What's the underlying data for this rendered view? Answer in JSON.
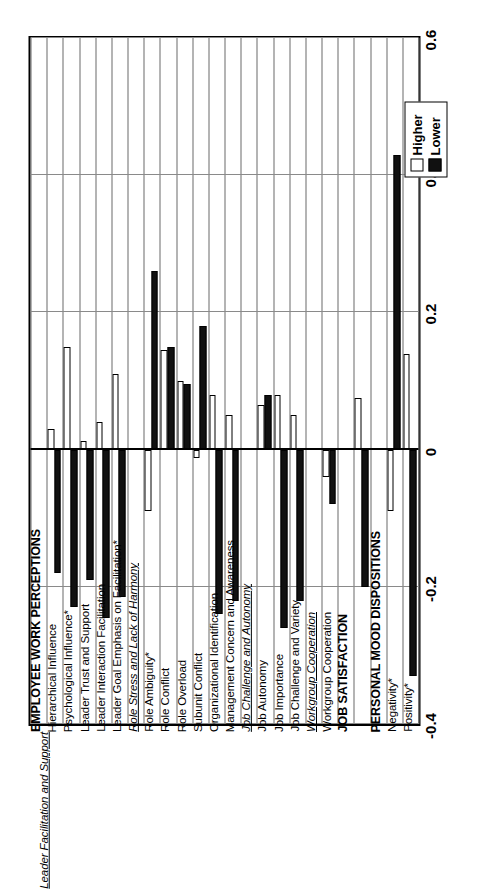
{
  "chart_data": {
    "type": "bar",
    "title": "",
    "orientation": "horizontal",
    "xlabel": "",
    "ylabel": "",
    "xlim": [
      -0.4,
      0.6
    ],
    "ticks": [
      "-0.4",
      "-0.2",
      "0",
      "0.2",
      "0.4",
      "0.6"
    ],
    "tick_values": [
      -0.4,
      -0.2,
      0,
      0.2,
      0.4,
      0.6
    ],
    "grid": true,
    "legend_position": "right",
    "series": [
      {
        "name": "Higher",
        "color": "#ffffff"
      },
      {
        "name": "Lower",
        "color": "#111111"
      }
    ],
    "groups": [
      {
        "header": "EMPLOYEE WORK PERCEPTIONS",
        "subheader": "Leader Facilitation and Support",
        "items": [
          {
            "label": "Hierarchical Influence",
            "higher": 0.03,
            "lower": -0.18
          },
          {
            "label": "Psychological Influence*",
            "higher": 0.15,
            "lower": -0.23
          },
          {
            "label": "Leader Trust and Support",
            "higher": 0.012,
            "lower": -0.19
          },
          {
            "label": "Leader Interaction Facilitation",
            "higher": 0.04,
            "lower": -0.245
          },
          {
            "label": "Leader Goal Emphasis on Facilitation*",
            "higher": 0.11,
            "lower": -0.215
          }
        ]
      },
      {
        "header": "",
        "subheader": "Role Stress and Lack of Harmony",
        "items": [
          {
            "label": "Role Ambiguity*",
            "higher": -0.09,
            "lower": 0.26
          },
          {
            "label": "Role Conflict",
            "higher": 0.145,
            "lower": 0.15
          },
          {
            "label": "Role Overload",
            "higher": 0.1,
            "lower": 0.095
          },
          {
            "label": "Subunit Conflict",
            "higher": -0.012,
            "lower": 0.18
          },
          {
            "label": "Organizational Identification",
            "higher": 0.08,
            "lower": -0.24
          },
          {
            "label": "Management Concern and Awareness",
            "higher": 0.05,
            "lower": -0.22
          }
        ]
      },
      {
        "header": "",
        "subheader": "Job Challenge and Autonomy",
        "items": [
          {
            "label": "Job Autonomy",
            "higher": 0.065,
            "lower": 0.08
          },
          {
            "label": "Job Importance",
            "higher": 0.08,
            "lower": -0.26
          },
          {
            "label": "Job Challenge and Variety",
            "higher": 0.05,
            "lower": -0.22
          }
        ]
      },
      {
        "header": "",
        "subheader": "Workgroup Cooperation",
        "items": [
          {
            "label": "Workgroup Cooperation",
            "higher": -0.04,
            "lower": -0.08
          }
        ]
      },
      {
        "header": "JOB SATISFACTION",
        "subheader": "",
        "items": [
          {
            "label": "",
            "higher": 0.075,
            "lower": -0.2
          }
        ]
      },
      {
        "header": "PERSONAL MOOD DISPOSITIONS",
        "subheader": "",
        "items": [
          {
            "label": "Negativity*",
            "higher": -0.09,
            "lower": 0.43
          },
          {
            "label": "Positivity*",
            "higher": 0.14,
            "lower": -0.33
          }
        ]
      }
    ]
  },
  "legend": {
    "items": [
      {
        "label": "Higher",
        "swatch": "white"
      },
      {
        "label": "Lower",
        "swatch": "black"
      }
    ]
  },
  "axis": {
    "labels": [
      "-0.4",
      "-0.2",
      "0",
      "0.2",
      "0.4",
      "0.6"
    ]
  }
}
